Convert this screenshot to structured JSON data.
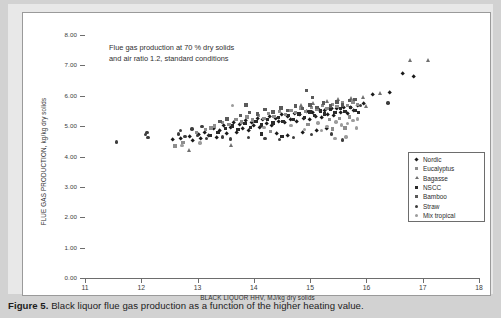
{
  "caption": {
    "label": "Figure 5.",
    "text": "Black liquor flue gas production as a function of the higher heating value."
  },
  "annotation": {
    "line1": "Flue gas production at 70 % dry solids",
    "line2": "and air ratio 1.2, standard conditions"
  },
  "chart_data": {
    "type": "scatter",
    "title": "",
    "xlabel": "BLACK LIQUOR HHV, MJ/kg dry solids",
    "ylabel": "FLUE GAS PRODUCTION, kg/kg dry solids",
    "xlim": [
      11,
      18
    ],
    "ylim": [
      0.0,
      8.0
    ],
    "xticks": [
      "11",
      "12",
      "13",
      "14",
      "15",
      "16",
      "17",
      "18"
    ],
    "yticks": [
      "0.00",
      "1.00",
      "2.00",
      "3.00",
      "4.00",
      "5.00",
      "6.00",
      "7.00",
      "8.00"
    ],
    "grid": false,
    "legend_position": "lower-right-inside",
    "annotations": [
      "Flue gas production at 70 % dry solids",
      "and air ratio 1.2, standard conditions"
    ],
    "series": [
      {
        "name": "Nordic",
        "marker": "diamond",
        "color": "#1a1a1a",
        "points": [
          [
            13.02,
            4.72
          ],
          [
            13.12,
            4.8
          ],
          [
            13.2,
            4.68
          ],
          [
            13.28,
            4.9
          ],
          [
            13.34,
            4.62
          ],
          [
            13.4,
            4.86
          ],
          [
            13.46,
            5.02
          ],
          [
            13.52,
            4.74
          ],
          [
            13.58,
            4.95
          ],
          [
            13.64,
            5.1
          ],
          [
            13.7,
            4.8
          ],
          [
            13.74,
            5.05
          ],
          [
            13.8,
            4.92
          ],
          [
            13.86,
            5.18
          ],
          [
            13.9,
            4.86
          ],
          [
            13.96,
            5.12
          ],
          [
            14.0,
            5.0
          ],
          [
            14.06,
            5.24
          ],
          [
            14.1,
            4.96
          ],
          [
            14.16,
            5.2
          ],
          [
            14.22,
            5.08
          ],
          [
            14.28,
            5.3
          ],
          [
            14.32,
            5.02
          ],
          [
            14.38,
            5.26
          ],
          [
            14.44,
            5.14
          ],
          [
            14.5,
            5.36
          ],
          [
            14.54,
            5.1
          ],
          [
            14.6,
            5.32
          ],
          [
            14.66,
            5.2
          ],
          [
            14.72,
            5.42
          ],
          [
            14.76,
            5.16
          ],
          [
            14.82,
            5.38
          ],
          [
            14.88,
            5.26
          ],
          [
            14.94,
            5.48
          ],
          [
            15.0,
            5.22
          ],
          [
            15.04,
            5.44
          ],
          [
            15.1,
            5.32
          ],
          [
            15.16,
            5.54
          ],
          [
            15.2,
            5.28
          ],
          [
            15.26,
            5.5
          ],
          [
            15.32,
            5.38
          ],
          [
            15.38,
            5.58
          ],
          [
            15.42,
            5.34
          ],
          [
            15.48,
            5.56
          ],
          [
            15.54,
            5.44
          ],
          [
            15.6,
            5.62
          ],
          [
            15.66,
            5.4
          ],
          [
            15.72,
            5.6
          ],
          [
            15.78,
            5.5
          ],
          [
            15.84,
            5.66
          ],
          [
            12.56,
            4.56
          ],
          [
            12.7,
            4.6
          ],
          [
            12.86,
            4.64
          ],
          [
            12.92,
            4.52
          ],
          [
            13.06,
            4.58
          ],
          [
            14.4,
            4.74
          ],
          [
            14.6,
            4.7
          ],
          [
            14.86,
            4.8
          ],
          [
            15.12,
            4.86
          ],
          [
            15.3,
            4.92
          ],
          [
            16.12,
            6.02
          ],
          [
            16.42,
            6.1
          ],
          [
            16.64,
            6.72
          ],
          [
            16.84,
            6.62
          ],
          [
            15.96,
            5.74
          ]
        ]
      },
      {
        "name": "Eucalyptus",
        "marker": "square",
        "color": "#8d8d8d",
        "points": [
          [
            13.3,
            5.0
          ],
          [
            13.44,
            5.12
          ],
          [
            13.56,
            5.06
          ],
          [
            13.68,
            5.22
          ],
          [
            13.78,
            5.14
          ],
          [
            13.88,
            5.3
          ],
          [
            13.98,
            5.2
          ],
          [
            14.08,
            5.34
          ],
          [
            14.18,
            5.26
          ],
          [
            14.26,
            5.42
          ],
          [
            14.36,
            5.32
          ],
          [
            14.46,
            5.48
          ],
          [
            14.56,
            5.38
          ],
          [
            14.66,
            5.52
          ],
          [
            14.74,
            5.44
          ],
          [
            14.84,
            5.58
          ],
          [
            14.92,
            5.48
          ],
          [
            15.02,
            5.62
          ],
          [
            15.12,
            5.54
          ],
          [
            15.22,
            5.68
          ],
          [
            15.3,
            5.58
          ],
          [
            15.4,
            5.72
          ],
          [
            15.48,
            5.64
          ],
          [
            15.58,
            5.76
          ],
          [
            15.66,
            5.68
          ],
          [
            15.76,
            5.8
          ],
          [
            15.84,
            5.72
          ],
          [
            13.14,
            4.88
          ],
          [
            13.24,
            4.94
          ],
          [
            12.98,
            4.8
          ],
          [
            12.6,
            4.34
          ],
          [
            12.74,
            4.46
          ],
          [
            15.34,
            5.22
          ],
          [
            15.52,
            5.26
          ],
          [
            15.7,
            5.3
          ],
          [
            15.4,
            4.9
          ],
          [
            15.62,
            4.94
          ],
          [
            14.3,
            4.82
          ],
          [
            14.96,
            5.06
          ]
        ]
      },
      {
        "name": "Bagasse",
        "marker": "triangle",
        "color": "#707070",
        "points": [
          [
            12.86,
            4.22
          ],
          [
            15.94,
            5.96
          ],
          [
            16.24,
            6.08
          ],
          [
            16.78,
            7.18
          ],
          [
            17.1,
            7.18
          ],
          [
            15.3,
            5.82
          ],
          [
            15.5,
            5.88
          ],
          [
            15.06,
            5.76
          ],
          [
            14.84,
            5.7
          ],
          [
            13.6,
            4.36
          ],
          [
            15.74,
            5.92
          ],
          [
            16.0,
            5.64
          ]
        ]
      },
      {
        "name": "NSCC",
        "marker": "square",
        "color": "#2a2a2a",
        "points": [
          [
            13.5,
            4.92
          ],
          [
            13.62,
            5.0
          ],
          [
            13.72,
            4.88
          ],
          [
            13.84,
            5.08
          ],
          [
            13.94,
            4.96
          ],
          [
            14.04,
            5.16
          ],
          [
            14.14,
            5.04
          ],
          [
            14.24,
            5.22
          ],
          [
            14.34,
            5.1
          ],
          [
            14.44,
            5.28
          ],
          [
            14.52,
            5.16
          ],
          [
            14.62,
            5.34
          ],
          [
            14.7,
            5.22
          ],
          [
            14.8,
            5.4
          ],
          [
            14.9,
            5.28
          ],
          [
            15.0,
            5.46
          ],
          [
            15.08,
            5.34
          ],
          [
            15.18,
            5.5
          ],
          [
            15.26,
            5.4
          ],
          [
            15.36,
            5.54
          ],
          [
            15.44,
            5.44
          ],
          [
            15.54,
            5.58
          ],
          [
            15.62,
            5.48
          ],
          [
            15.72,
            5.62
          ],
          [
            15.8,
            5.52
          ],
          [
            14.14,
            4.74
          ],
          [
            14.5,
            4.66
          ],
          [
            13.36,
            4.78
          ],
          [
            13.22,
            4.7
          ],
          [
            15.86,
            5.44
          ]
        ]
      },
      {
        "name": "Bamboo",
        "marker": "square",
        "color": "#5a5a5a",
        "points": [
          [
            13.76,
            5.34
          ],
          [
            13.92,
            5.44
          ],
          [
            14.06,
            5.4
          ],
          [
            14.2,
            5.54
          ],
          [
            14.34,
            5.46
          ],
          [
            14.48,
            5.6
          ],
          [
            14.6,
            5.52
          ],
          [
            14.74,
            5.66
          ],
          [
            14.86,
            5.58
          ],
          [
            15.0,
            5.7
          ],
          [
            15.12,
            5.62
          ],
          [
            15.24,
            5.76
          ],
          [
            15.36,
            5.66
          ],
          [
            15.48,
            5.8
          ],
          [
            15.58,
            5.7
          ],
          [
            15.7,
            5.84
          ],
          [
            13.52,
            5.24
          ],
          [
            13.4,
            5.16
          ],
          [
            15.8,
            5.88
          ],
          [
            14.94,
            6.18
          ],
          [
            13.86,
            5.7
          ],
          [
            15.04,
            5.94
          ]
        ]
      },
      {
        "name": "Straw",
        "marker": "circle",
        "color": "#3d3d3d",
        "points": [
          [
            11.56,
            4.48
          ],
          [
            12.08,
            4.72
          ],
          [
            12.1,
            4.8
          ],
          [
            12.12,
            4.62
          ],
          [
            12.66,
            4.74
          ],
          [
            12.7,
            4.86
          ],
          [
            12.78,
            4.66
          ],
          [
            12.9,
            4.9
          ],
          [
            13.0,
            4.7
          ],
          [
            13.08,
            4.98
          ],
          [
            13.16,
            4.6
          ],
          [
            13.44,
            4.64
          ],
          [
            13.58,
            4.58
          ],
          [
            13.9,
            4.62
          ],
          [
            14.2,
            4.6
          ],
          [
            14.46,
            4.56
          ],
          [
            14.7,
            4.62
          ],
          [
            15.02,
            4.72
          ],
          [
            15.38,
            4.74
          ],
          [
            15.58,
            4.54
          ],
          [
            16.38,
            5.76
          ],
          [
            15.9,
            5.68
          ]
        ]
      },
      {
        "name": "Mix tropical",
        "marker": "circle",
        "color": "#9c9c9c",
        "points": [
          [
            12.72,
            4.36
          ],
          [
            13.04,
            4.44
          ],
          [
            13.62,
            5.68
          ],
          [
            14.18,
            4.96
          ],
          [
            14.66,
            5.02
          ],
          [
            15.14,
            5.1
          ],
          [
            15.46,
            5.14
          ],
          [
            15.56,
            5.04
          ],
          [
            15.66,
            5.08
          ],
          [
            15.76,
            5.18
          ],
          [
            15.3,
            4.98
          ],
          [
            15.84,
            5.24
          ],
          [
            15.2,
            4.86
          ],
          [
            14.9,
            4.88
          ],
          [
            15.64,
            4.64
          ],
          [
            15.44,
            4.6
          ],
          [
            15.82,
            4.94
          ]
        ]
      }
    ]
  }
}
